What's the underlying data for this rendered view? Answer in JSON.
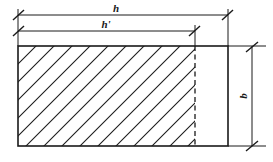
{
  "diagram": {
    "colors": {
      "line": "#1a1a1a",
      "background": "#ffffff",
      "hatch": "#1a1a1a"
    },
    "labels": {
      "overall_width": "h",
      "effective_width": "h'",
      "height": "b"
    },
    "geometry": {
      "rect": {
        "x": 18,
        "y": 46,
        "width": 210,
        "height": 100
      },
      "hatch_boundary_x": 195,
      "dim_h_y": 15,
      "dim_h_prime_y": 31,
      "dim_b_x": 252,
      "hatch_angle_deg": 45,
      "hatch_spacing": 18
    }
  }
}
